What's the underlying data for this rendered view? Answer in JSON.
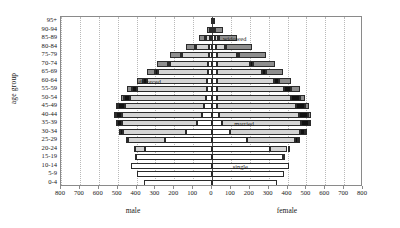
{
  "chart_data": {
    "type": "bar",
    "subtype": "population-pyramid-stacked",
    "title": "",
    "xlabel": "",
    "ylabel": "age group",
    "side_labels": {
      "left": "male",
      "right": "female"
    },
    "grid": true,
    "legend_position": "in-plot-annotations",
    "xlim": [
      -800,
      800
    ],
    "xticks": [
      800,
      700,
      600,
      500,
      400,
      300,
      200,
      100,
      0,
      100,
      200,
      300,
      400,
      500,
      600,
      700,
      800
    ],
    "xtick_labels": [
      "800",
      "700",
      "600",
      "500",
      "400",
      "300",
      "200",
      "100",
      "0",
      "100",
      "200",
      "300",
      "400",
      "500",
      "600",
      "700",
      "800"
    ],
    "categories": [
      "95+",
      "90-94",
      "85-89",
      "80-84",
      "75-79",
      "70-74",
      "65-69",
      "60-64",
      "55-59",
      "50-54",
      "45-49",
      "40-44",
      "35-39",
      "30-34",
      "25-29",
      "20-24",
      "15-19",
      "10-14",
      "5-9",
      "0-4"
    ],
    "segment_names": [
      "single",
      "married",
      "divorced",
      "widowed"
    ],
    "segment_colors": {
      "single": "#ffffff",
      "married": "#d4d4d4",
      "divorced": "#111111",
      "widowed": "#8e8e8e"
    },
    "annotations": [
      {
        "text": "widowed",
        "age_group": "85-89",
        "side": "female",
        "value": 120
      },
      {
        "text": "divorced",
        "age_group": "60-64",
        "side": "male",
        "value": 330
      },
      {
        "text": "married",
        "age_group": "35-39",
        "side": "female",
        "value": 170
      },
      {
        "text": "single",
        "age_group": "10-14",
        "side": "female",
        "value": 150
      }
    ],
    "series": [
      {
        "name": "male",
        "direction": "left",
        "data": [
          {
            "age_group": "95+",
            "single": 2,
            "married": 1,
            "divorced": 0,
            "widowed": 3,
            "total": 6
          },
          {
            "age_group": "90-94",
            "single": 5,
            "married": 6,
            "divorced": 1,
            "widowed": 12,
            "total": 24
          },
          {
            "age_group": "85-89",
            "single": 10,
            "married": 26,
            "divorced": 2,
            "widowed": 30,
            "total": 68
          },
          {
            "age_group": "80-84",
            "single": 14,
            "married": 70,
            "divorced": 4,
            "widowed": 52,
            "total": 140
          },
          {
            "age_group": "75-79",
            "single": 18,
            "married": 140,
            "divorced": 7,
            "widowed": 60,
            "total": 225
          },
          {
            "age_group": "70-74",
            "single": 20,
            "married": 205,
            "divorced": 10,
            "widowed": 55,
            "total": 290
          },
          {
            "age_group": "65-69",
            "single": 22,
            "married": 265,
            "divorced": 14,
            "widowed": 44,
            "total": 345
          },
          {
            "age_group": "60-64",
            "single": 24,
            "married": 320,
            "divorced": 20,
            "widowed": 32,
            "total": 396
          },
          {
            "age_group": "55-59",
            "single": 28,
            "married": 370,
            "divorced": 28,
            "widowed": 22,
            "total": 448
          },
          {
            "age_group": "50-54",
            "single": 32,
            "married": 400,
            "divorced": 34,
            "widowed": 14,
            "total": 480
          },
          {
            "age_group": "45-49",
            "single": 40,
            "married": 420,
            "divorced": 38,
            "widowed": 9,
            "total": 507
          },
          {
            "age_group": "40-44",
            "single": 55,
            "married": 420,
            "divorced": 36,
            "widowed": 6,
            "total": 517
          },
          {
            "age_group": "35-39",
            "single": 80,
            "married": 395,
            "divorced": 30,
            "widowed": 4,
            "total": 509
          },
          {
            "age_group": "30-34",
            "single": 140,
            "married": 330,
            "divorced": 20,
            "widowed": 2,
            "total": 492
          },
          {
            "age_group": "25-29",
            "single": 250,
            "married": 195,
            "divorced": 9,
            "widowed": 1,
            "total": 455
          },
          {
            "age_group": "20-24",
            "single": 355,
            "married": 55,
            "divorced": 2,
            "widowed": 0,
            "total": 412
          },
          {
            "age_group": "15-19",
            "single": 405,
            "married": 5,
            "divorced": 0,
            "widowed": 0,
            "total": 410
          },
          {
            "age_group": "10-14",
            "single": 430,
            "married": 0,
            "divorced": 0,
            "widowed": 0,
            "total": 430
          },
          {
            "age_group": "5-9",
            "single": 400,
            "married": 0,
            "divorced": 0,
            "widowed": 0,
            "total": 400
          },
          {
            "age_group": "0-4",
            "single": 360,
            "married": 0,
            "divorced": 0,
            "widowed": 0,
            "total": 360
          }
        ]
      },
      {
        "name": "female",
        "direction": "right",
        "data": [
          {
            "age_group": "95+",
            "single": 3,
            "married": 1,
            "divorced": 0,
            "widowed": 14,
            "total": 18
          },
          {
            "age_group": "90-94",
            "single": 8,
            "married": 5,
            "divorced": 1,
            "widowed": 46,
            "total": 60
          },
          {
            "age_group": "85-89",
            "single": 14,
            "married": 18,
            "divorced": 3,
            "widowed": 95,
            "total": 130
          },
          {
            "age_group": "80-84",
            "single": 20,
            "married": 50,
            "divorced": 6,
            "widowed": 134,
            "total": 210
          },
          {
            "age_group": "75-79",
            "single": 24,
            "married": 110,
            "divorced": 11,
            "widowed": 140,
            "total": 285
          },
          {
            "age_group": "70-74",
            "single": 26,
            "married": 175,
            "divorced": 16,
            "widowed": 118,
            "total": 335
          },
          {
            "age_group": "65-69",
            "single": 26,
            "married": 240,
            "divorced": 22,
            "widowed": 90,
            "total": 378
          },
          {
            "age_group": "60-64",
            "single": 26,
            "married": 300,
            "divorced": 30,
            "widowed": 64,
            "total": 420
          },
          {
            "age_group": "55-59",
            "single": 26,
            "married": 355,
            "divorced": 40,
            "widowed": 44,
            "total": 465
          },
          {
            "age_group": "50-54",
            "single": 26,
            "married": 390,
            "divorced": 48,
            "widowed": 28,
            "total": 492
          },
          {
            "age_group": "45-49",
            "single": 28,
            "married": 415,
            "divorced": 52,
            "widowed": 18,
            "total": 513
          },
          {
            "age_group": "40-44",
            "single": 36,
            "married": 425,
            "divorced": 50,
            "widowed": 11,
            "total": 522
          },
          {
            "age_group": "35-39",
            "single": 52,
            "married": 420,
            "divorced": 42,
            "widowed": 7,
            "total": 521
          },
          {
            "age_group": "30-34",
            "single": 95,
            "married": 370,
            "divorced": 28,
            "widowed": 4,
            "total": 497
          },
          {
            "age_group": "25-29",
            "single": 185,
            "married": 255,
            "divorced": 14,
            "widowed": 2,
            "total": 456
          },
          {
            "age_group": "20-24",
            "single": 305,
            "married": 95,
            "divorced": 4,
            "widowed": 1,
            "total": 405
          },
          {
            "age_group": "15-19",
            "single": 375,
            "married": 14,
            "divorced": 0,
            "widowed": 0,
            "total": 389
          },
          {
            "age_group": "10-14",
            "single": 410,
            "married": 0,
            "divorced": 0,
            "widowed": 0,
            "total": 410
          },
          {
            "age_group": "5-9",
            "single": 380,
            "married": 0,
            "divorced": 0,
            "widowed": 0,
            "total": 380
          },
          {
            "age_group": "0-4",
            "single": 345,
            "married": 0,
            "divorced": 0,
            "widowed": 0,
            "total": 345
          }
        ]
      }
    ]
  }
}
